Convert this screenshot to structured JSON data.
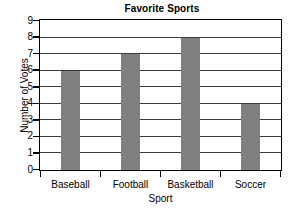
{
  "chart_data": {
    "type": "bar",
    "title": "Favorite Sports",
    "xlabel": "Sport",
    "ylabel": "Number of Votes",
    "categories": [
      "Baseball",
      "Football",
      "Basketball",
      "Soccer"
    ],
    "values": [
      6,
      7,
      8,
      4
    ],
    "ylim": [
      0,
      9
    ],
    "ytick_labels": [
      "0",
      "1",
      "2",
      "3",
      "4",
      "5",
      "6",
      "7",
      "8",
      "9"
    ],
    "ytick_values": [
      0,
      1,
      2,
      3,
      4,
      5,
      6,
      7,
      8,
      9
    ],
    "grid": true,
    "legend": false,
    "bar_color": "#808080",
    "axis_color": "#000000",
    "grid_color": "#3a3a3a",
    "background_color": "#ffffff"
  }
}
